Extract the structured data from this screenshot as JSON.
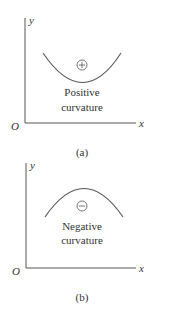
{
  "panel_a": {
    "y_label": "y",
    "x_label": "x",
    "origin_label": "O",
    "sign_symbol": "⊕",
    "text_line1": "Positive",
    "text_line2": "curvature",
    "caption": "(a)"
  },
  "panel_b": {
    "y_label": "y",
    "x_label": "x",
    "origin_label": "O",
    "sign_symbol": "⊖",
    "text_line1": "Negative",
    "text_line2": "curvature",
    "caption": "(b)"
  },
  "colors": {
    "axis": "#555555",
    "curve": "#555555",
    "text": "#333333"
  }
}
